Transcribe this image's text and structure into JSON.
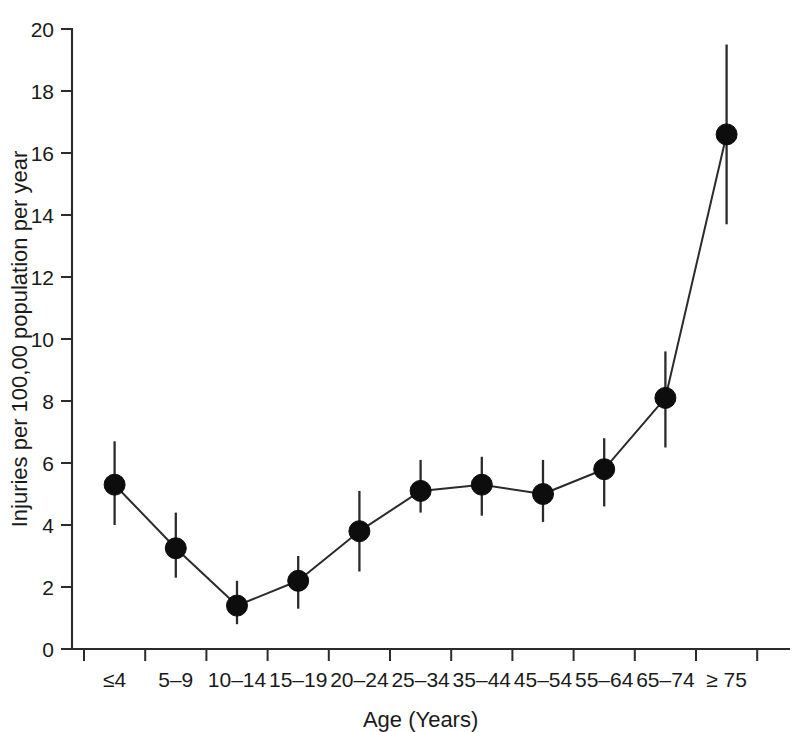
{
  "chart_data": {
    "type": "line",
    "title": "",
    "xlabel": "Age (Years)",
    "ylabel": "Injuries per 100,00 population per year",
    "categories": [
      "≤4",
      "5–9",
      "10–14",
      "15–19",
      "20–24",
      "25–34",
      "35–44",
      "45–54",
      "55–64",
      "65–74",
      "≥ 75"
    ],
    "values": [
      5.3,
      3.25,
      1.4,
      2.2,
      3.8,
      5.1,
      5.3,
      5.0,
      5.8,
      8.1,
      16.6
    ],
    "error_low": [
      4.0,
      2.3,
      0.8,
      1.3,
      2.5,
      4.4,
      4.3,
      4.1,
      4.6,
      6.5,
      13.7
    ],
    "error_high": [
      6.7,
      4.4,
      2.2,
      3.0,
      5.1,
      6.1,
      6.2,
      6.1,
      6.8,
      9.6,
      19.5
    ],
    "ylim": [
      0,
      20
    ],
    "ytick_values": [
      0,
      2,
      4,
      6,
      8,
      10,
      12,
      14,
      16,
      18,
      20
    ],
    "ytick_labels": [
      "0",
      "2",
      "4",
      "6",
      "8",
      "10",
      "12",
      "14",
      "16",
      "18",
      "20"
    ],
    "grid": false,
    "legend": "none",
    "marker": "filled-circle",
    "series_name": "Injury rate"
  }
}
